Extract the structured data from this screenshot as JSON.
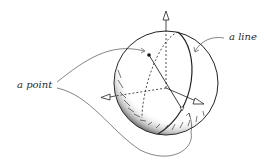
{
  "diagram": {
    "labels": {
      "point": "a point",
      "line": "a line"
    },
    "elements": [
      "sphere",
      "great-circle line",
      "two antipodal points",
      "three coordinate axes"
    ],
    "colors": {
      "ink": "#2a2a2a",
      "background": "#ffffff"
    }
  }
}
